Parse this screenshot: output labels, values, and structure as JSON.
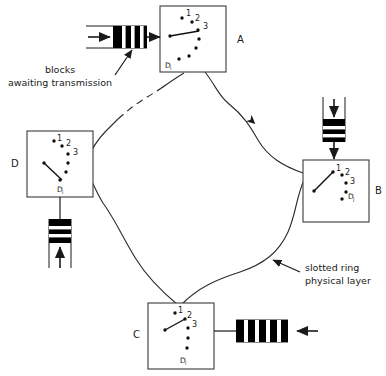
{
  "figure": {
    "caption": ""
  },
  "colors": {
    "ink": "#1a1a1a",
    "line": "#333333",
    "block_fill": "#000000",
    "block_stripe": "#ffffff",
    "paper": "#ffffff"
  },
  "nodes": [
    {
      "id": "A",
      "label": "A",
      "label_pos": "right",
      "internal_labels": [
        "1",
        "2",
        "3",
        "D"
      ],
      "subscript": "i"
    },
    {
      "id": "B",
      "label": "B",
      "label_pos": "right",
      "internal_labels": [
        "1",
        "2",
        "3",
        "D"
      ],
      "subscript": "j"
    },
    {
      "id": "C",
      "label": "C",
      "label_pos": "left",
      "internal_labels": [
        "1",
        "2",
        "3",
        "D"
      ],
      "subscript": "i"
    },
    {
      "id": "D",
      "label": "D",
      "label_pos": "left",
      "internal_labels": [
        "1",
        "2",
        "3",
        "D"
      ],
      "subscript": "i"
    }
  ],
  "annotations": [
    {
      "id": "blocks-awaiting",
      "line1": "blocks",
      "line2": "awaiting transmission"
    },
    {
      "id": "slotted-ring",
      "line1": "slotted ring",
      "line2": "physical layer"
    }
  ],
  "queues": [
    {
      "id": "queue-a",
      "node": "A",
      "orientation": "horizontal",
      "stripes": 3,
      "direction": "in-from-left"
    },
    {
      "id": "queue-b",
      "node": "B",
      "orientation": "vertical",
      "stripes": 2,
      "direction": "in-from-top"
    },
    {
      "id": "queue-c",
      "node": "C",
      "orientation": "horizontal",
      "stripes": 4,
      "direction": "in-from-right"
    },
    {
      "id": "queue-d",
      "node": "D",
      "orientation": "vertical",
      "stripes": 2,
      "direction": "in-from-bottom"
    }
  ],
  "ring": {
    "segments": [
      "A-to-B",
      "B-to-C",
      "C-to-D",
      "D-to-A"
    ],
    "dashed_segment": "D-to-A",
    "flow": "clockwise"
  }
}
